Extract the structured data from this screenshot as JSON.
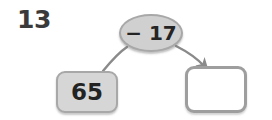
{
  "worksheet": {
    "question_number": "13",
    "type": "function-machine",
    "operation": {
      "label": "− 17",
      "operator": "−",
      "operand": "17"
    },
    "input_box": {
      "value": "65",
      "state": "filled"
    },
    "output_box": {
      "value": "",
      "state": "empty",
      "placeholder": ""
    },
    "connectors": [
      {
        "name": "input-connector",
        "from": "input-box",
        "to": "operation-oval",
        "arrowhead": false
      },
      {
        "name": "output-arrow",
        "from": "operation-oval",
        "to": "output-box",
        "arrowhead": true
      }
    ],
    "colors": {
      "page_background": "#ffffff",
      "box_fill": "#d6d6d6",
      "box_border": "#a8a8a8",
      "oval_fill": "#d0d0d0",
      "oval_border": "#a8a8a8",
      "empty_box_fill": "#ffffff",
      "empty_box_border": "#9e9e9e",
      "connector_stroke": "#8a8a8a",
      "text": "#232323",
      "question_number_text": "#3a3a3a"
    }
  }
}
